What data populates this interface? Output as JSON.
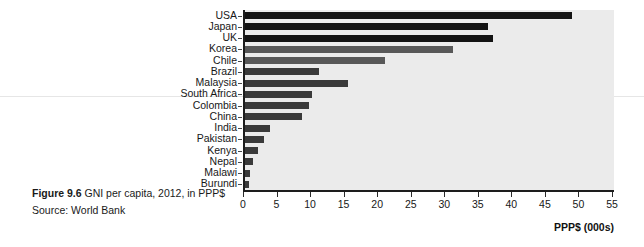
{
  "caption": {
    "figure_number": "Figure 9.6",
    "title": " GNI per capita, 2012, in PPP$",
    "source": "Source: World Bank"
  },
  "chart_data": {
    "type": "bar",
    "orientation": "horizontal",
    "title": "GNI per capita, 2012, in PPP$",
    "xlabel": "PPP$ (000s)",
    "ylabel": "",
    "xlim": [
      0,
      55
    ],
    "xticks": [
      0,
      5,
      10,
      15,
      20,
      25,
      30,
      35,
      40,
      45,
      50,
      55
    ],
    "grid": false,
    "legend": "none",
    "categories": [
      "USA",
      "Japan",
      "UK",
      "Korea",
      "Chile",
      "Brazil",
      "Malaysia",
      "South Africa",
      "Colombia",
      "China",
      "India",
      "Pakistan",
      "Kenya",
      "Nepal",
      "Malawi",
      "Burundi"
    ],
    "values": [
      48.8,
      36.2,
      36.9,
      31.0,
      20.8,
      11.0,
      15.3,
      10.0,
      9.6,
      8.5,
      3.7,
      2.8,
      2.0,
      1.2,
      0.75,
      0.55
    ],
    "bar_colors": [
      "#131313",
      "#131313",
      "#131313",
      "#585858",
      "#585858",
      "#3a3a3a",
      "#3a3a3a",
      "#3a3a3a",
      "#3a3a3a",
      "#3a3a3a",
      "#3a3a3a",
      "#3a3a3a",
      "#3a3a3a",
      "#3a3a3a",
      "#3a3a3a",
      "#3a3a3a"
    ],
    "plot_background": "#ebebeb",
    "axis_color": "#1d1d1d"
  }
}
